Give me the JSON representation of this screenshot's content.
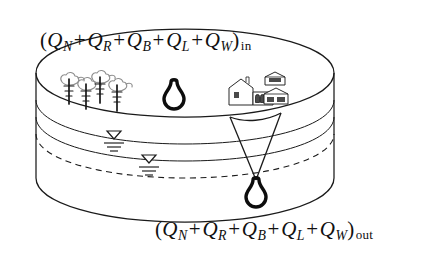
{
  "figure": {
    "type": "schematic-diagram"
  },
  "formulas": {
    "inflow": {
      "open_paren": "(",
      "close_paren": ")",
      "terms": [
        {
          "symbol": "Q",
          "subscript": "N"
        },
        {
          "symbol": "Q",
          "subscript": "R"
        },
        {
          "symbol": "Q",
          "subscript": "B"
        },
        {
          "symbol": "Q",
          "subscript": "L"
        },
        {
          "symbol": "Q",
          "subscript": "W"
        }
      ],
      "operator": "+",
      "condition": "in",
      "plain_text": "(QN + QR + QB + QL + QW)in"
    },
    "outflow": {
      "open_paren": "(",
      "close_paren": ")",
      "terms": [
        {
          "symbol": "Q",
          "subscript": "N"
        },
        {
          "symbol": "Q",
          "subscript": "R"
        },
        {
          "symbol": "Q",
          "subscript": "B"
        },
        {
          "symbol": "Q",
          "subscript": "L"
        },
        {
          "symbol": "Q",
          "subscript": "W"
        }
      ],
      "operator": "+",
      "condition": "out",
      "plain_text": "(QN + QR + QB + QL + QW)out"
    }
  },
  "features": {
    "trees": {
      "label": "vegetation",
      "count": 4
    },
    "buildings": {
      "label": "urban-area",
      "count": 3
    },
    "upper_well": {
      "label": "well-symbol-upper"
    },
    "lower_well": {
      "label": "well-symbol-lower"
    },
    "cone_of_depression": {
      "label": "cone-of-depression"
    },
    "water_table_marks": {
      "label": "water-table-symbol",
      "count": 2
    },
    "strata_lines": {
      "label": "geologic-strata",
      "count": 2
    },
    "dashed_line": {
      "label": "water-table-surface"
    }
  },
  "colors": {
    "ink": "#1a1a1a",
    "well": "#0d0d0d",
    "canopy": "#8e8e8e",
    "background": "#ffffff"
  }
}
